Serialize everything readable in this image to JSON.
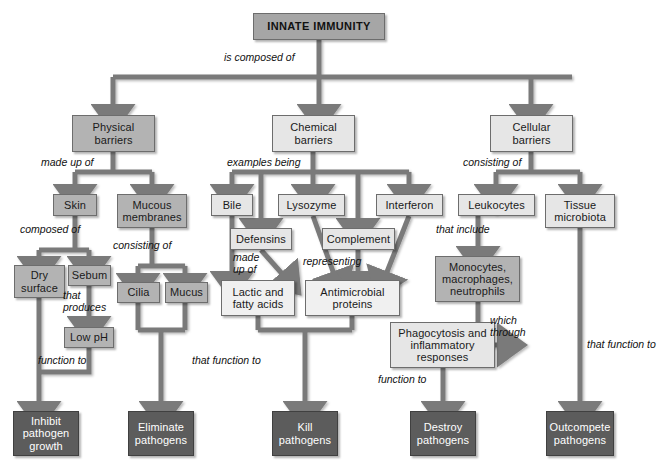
{
  "diagram": {
    "title": "INNATE IMMUNITY",
    "type": "concept-map",
    "colors": {
      "root_fill": "#a6a6a6",
      "mid_fill": "#b3b3b3",
      "light_fill": "#e6e6e6",
      "lightest_fill": "#f0f0f0",
      "outcome_fill": "#5c5c5c",
      "outcome_text": "#ffffff",
      "connector": "#7a7a7a",
      "border": "#6d6d6d"
    },
    "nodes": {
      "root": "INNATE IMMUNITY",
      "physical_barriers": "Physical barriers",
      "chemical_barriers": "Chemical barriers",
      "cellular_barriers": "Cellular barriers",
      "skin": "Skin",
      "mucous_membranes": "Mucous membranes",
      "bile": "Bile",
      "lysozyme": "Lysozyme",
      "interferon": "Interferon",
      "leukocytes": "Leukocytes",
      "tissue_microbiota": "Tissue microbiota",
      "dry_surface": "Dry surface",
      "sebum": "Sebum",
      "cilia": "Cilia",
      "mucus": "Mucus",
      "defensins": "Defensins",
      "complement": "Complement",
      "low_ph": "Low pH",
      "lactic_fatty_acids": "Lactic and fatty acids",
      "antimicrobial_proteins": "Antimicrobial proteins",
      "monocytes": "Monocytes, macrophages, neutrophils",
      "phagocytosis": "Phagocytosis and inflammatory responses",
      "inhibit": "Inhibit pathogen growth",
      "eliminate": "Eliminate pathogens",
      "kill": "Kill pathogens",
      "destroy": "Destroy pathogens",
      "outcompete": "Outcompete pathogens"
    },
    "edge_labels": {
      "is_composed_of": "is composed of",
      "made_up_of": "made up of",
      "examples_being": "examples being",
      "consisting_of_cellular": "consisting of",
      "composed_of": "composed of",
      "consisting_of_mucous": "consisting of",
      "that_include": "that include",
      "made_up_of_2": "made up of",
      "representing": "representing",
      "that_produces": "that produces",
      "function_to_left": "function to",
      "that_function_to_mid": "that function to",
      "which_through": "which through",
      "function_to_phago": "function to",
      "that_function_to_right": "that function to"
    }
  }
}
